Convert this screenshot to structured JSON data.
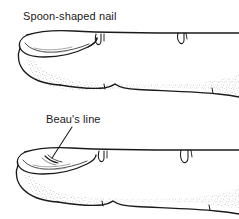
{
  "figure": {
    "type": "medical-illustration",
    "background_color": "#ffffff",
    "ink_color": "#1a1a1a",
    "panels": [
      {
        "id": "spoon-nail",
        "label": "Spoon-shaped nail",
        "position": "top",
        "description": "Lateral profile of a finger with a concave, upturned nail plate (koilonychia)",
        "has_leader_line": false
      },
      {
        "id": "beaus-line",
        "label": "Beau's line",
        "position": "bottom",
        "description": "Lateral profile of a finger with a transverse depression across the nail plate",
        "has_leader_line": true
      }
    ]
  },
  "labels": {
    "spoon_nail": "Spoon-shaped nail",
    "beaus_line": "Beau's line"
  }
}
